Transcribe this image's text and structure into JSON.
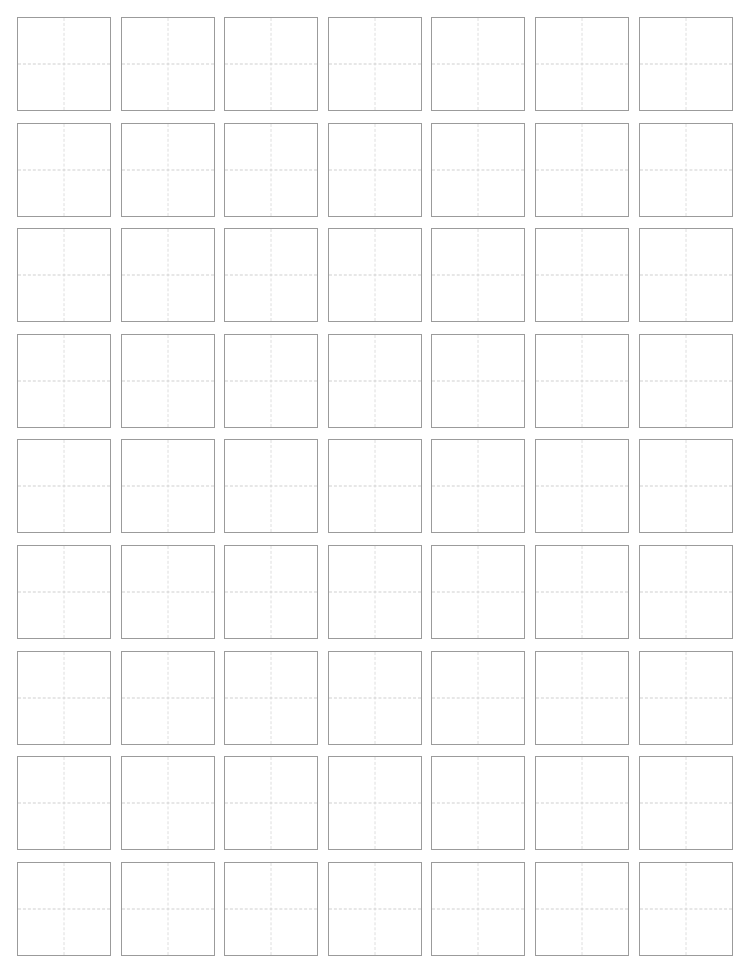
{
  "document": {
    "title": "Character Practice Grid Worksheet",
    "page_width": 736,
    "page_height": 965,
    "background_color": "#ffffff"
  },
  "grid": {
    "name": "tian-zi-ge-practice-grid",
    "rows": 9,
    "columns": 7,
    "total_cells": 63,
    "cell_width": 94,
    "cell_height": 94,
    "column_gap": 10,
    "row_gap": 12,
    "origin_x": 17,
    "origin_y": 17,
    "cell_border_color": "#9b9b9b",
    "cell_border_width": 1,
    "cell_background": "#ffffff",
    "guide_horizontal_color": "#cfcfcf",
    "guide_vertical_color": "#dedede",
    "guide_style": "dashed",
    "guides_per_cell": 2
  },
  "cells": [
    {
      "row": 1,
      "col": 1,
      "text": ""
    },
    {
      "row": 1,
      "col": 2,
      "text": ""
    },
    {
      "row": 1,
      "col": 3,
      "text": ""
    },
    {
      "row": 1,
      "col": 4,
      "text": ""
    },
    {
      "row": 1,
      "col": 5,
      "text": ""
    },
    {
      "row": 1,
      "col": 6,
      "text": ""
    },
    {
      "row": 1,
      "col": 7,
      "text": ""
    },
    {
      "row": 2,
      "col": 1,
      "text": ""
    },
    {
      "row": 2,
      "col": 2,
      "text": ""
    },
    {
      "row": 2,
      "col": 3,
      "text": ""
    },
    {
      "row": 2,
      "col": 4,
      "text": ""
    },
    {
      "row": 2,
      "col": 5,
      "text": ""
    },
    {
      "row": 2,
      "col": 6,
      "text": ""
    },
    {
      "row": 2,
      "col": 7,
      "text": ""
    },
    {
      "row": 3,
      "col": 1,
      "text": ""
    },
    {
      "row": 3,
      "col": 2,
      "text": ""
    },
    {
      "row": 3,
      "col": 3,
      "text": ""
    },
    {
      "row": 3,
      "col": 4,
      "text": ""
    },
    {
      "row": 3,
      "col": 5,
      "text": ""
    },
    {
      "row": 3,
      "col": 6,
      "text": ""
    },
    {
      "row": 3,
      "col": 7,
      "text": ""
    },
    {
      "row": 4,
      "col": 1,
      "text": ""
    },
    {
      "row": 4,
      "col": 2,
      "text": ""
    },
    {
      "row": 4,
      "col": 3,
      "text": ""
    },
    {
      "row": 4,
      "col": 4,
      "text": ""
    },
    {
      "row": 4,
      "col": 5,
      "text": ""
    },
    {
      "row": 4,
      "col": 6,
      "text": ""
    },
    {
      "row": 4,
      "col": 7,
      "text": ""
    },
    {
      "row": 5,
      "col": 1,
      "text": ""
    },
    {
      "row": 5,
      "col": 2,
      "text": ""
    },
    {
      "row": 5,
      "col": 3,
      "text": ""
    },
    {
      "row": 5,
      "col": 4,
      "text": ""
    },
    {
      "row": 5,
      "col": 5,
      "text": ""
    },
    {
      "row": 5,
      "col": 6,
      "text": ""
    },
    {
      "row": 5,
      "col": 7,
      "text": ""
    },
    {
      "row": 6,
      "col": 1,
      "text": ""
    },
    {
      "row": 6,
      "col": 2,
      "text": ""
    },
    {
      "row": 6,
      "col": 3,
      "text": ""
    },
    {
      "row": 6,
      "col": 4,
      "text": ""
    },
    {
      "row": 6,
      "col": 5,
      "text": ""
    },
    {
      "row": 6,
      "col": 6,
      "text": ""
    },
    {
      "row": 6,
      "col": 7,
      "text": ""
    },
    {
      "row": 7,
      "col": 1,
      "text": ""
    },
    {
      "row": 7,
      "col": 2,
      "text": ""
    },
    {
      "row": 7,
      "col": 3,
      "text": ""
    },
    {
      "row": 7,
      "col": 4,
      "text": ""
    },
    {
      "row": 7,
      "col": 5,
      "text": ""
    },
    {
      "row": 7,
      "col": 6,
      "text": ""
    },
    {
      "row": 7,
      "col": 7,
      "text": ""
    },
    {
      "row": 8,
      "col": 1,
      "text": ""
    },
    {
      "row": 8,
      "col": 2,
      "text": ""
    },
    {
      "row": 8,
      "col": 3,
      "text": ""
    },
    {
      "row": 8,
      "col": 4,
      "text": ""
    },
    {
      "row": 8,
      "col": 5,
      "text": ""
    },
    {
      "row": 8,
      "col": 6,
      "text": ""
    },
    {
      "row": 8,
      "col": 7,
      "text": ""
    },
    {
      "row": 9,
      "col": 1,
      "text": ""
    },
    {
      "row": 9,
      "col": 2,
      "text": ""
    },
    {
      "row": 9,
      "col": 3,
      "text": ""
    },
    {
      "row": 9,
      "col": 4,
      "text": ""
    },
    {
      "row": 9,
      "col": 5,
      "text": ""
    },
    {
      "row": 9,
      "col": 6,
      "text": ""
    },
    {
      "row": 9,
      "col": 7,
      "text": ""
    }
  ]
}
